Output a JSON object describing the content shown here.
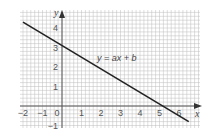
{
  "chart_data": {
    "type": "line",
    "title": "",
    "xlabel": "x",
    "ylabel": "y",
    "xlim": [
      -2,
      7
    ],
    "ylim": [
      -1.1,
      5
    ],
    "grid": true,
    "minor_per_unit": 5,
    "x_ticks": [
      -2,
      -1,
      0,
      1,
      2,
      3,
      4,
      5,
      6
    ],
    "x_tick_labels": [
      "−2",
      "−1",
      "0",
      "1",
      "2",
      "3",
      "4",
      "5",
      "6"
    ],
    "y_ticks": [
      -1,
      1,
      2,
      3,
      4
    ],
    "y_tick_labels": [
      "−1",
      "1",
      "2",
      "3",
      "4"
    ],
    "series": [
      {
        "name": "y = ax + b",
        "x": [
          -2,
          6.5
        ],
        "y": [
          4.3,
          -0.8
        ],
        "slope": -0.6,
        "intercept": 3.2,
        "color": "#222222"
      }
    ],
    "annotations": [
      {
        "text": "y = ax + b",
        "x": 1.8,
        "y": 2.3
      }
    ]
  }
}
